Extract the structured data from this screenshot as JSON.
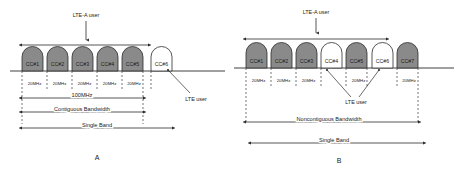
{
  "diagrams": [
    {
      "caption": "A",
      "user_span_label": "LTE-A user",
      "lte_user_label": "LTE user",
      "carriers": [
        {
          "label": "CC#1",
          "filled": true,
          "bandwidth": "20MHz"
        },
        {
          "label": "CC#2",
          "filled": true,
          "bandwidth": "20MHz"
        },
        {
          "label": "CC#3",
          "filled": true,
          "bandwidth": "20MHz"
        },
        {
          "label": "CC#4",
          "filled": true,
          "bandwidth": "20MHz"
        },
        {
          "label": "CC#5",
          "filled": true,
          "bandwidth": "20MHz"
        },
        {
          "label": "CC#6",
          "filled": false,
          "bandwidth": ""
        }
      ],
      "measures": [
        {
          "label": "100MHz"
        },
        {
          "label": "Contiguous Bandwidth"
        },
        {
          "label": "Single Band"
        }
      ]
    },
    {
      "caption": "B",
      "user_span_label": "LTE-A user",
      "lte_user_label": "LTE user",
      "carriers": [
        {
          "label": "CC#1",
          "filled": true,
          "bandwidth": "20MHz"
        },
        {
          "label": "CC#2",
          "filled": true,
          "bandwidth": "20MHz"
        },
        {
          "label": "CC#3",
          "filled": true,
          "bandwidth": "20MHz"
        },
        {
          "label": "CC#4",
          "filled": false,
          "bandwidth": ""
        },
        {
          "label": "CC#5",
          "filled": true,
          "bandwidth": "20MHz"
        },
        {
          "label": "CC#6",
          "filled": false,
          "bandwidth": ""
        },
        {
          "label": "CC#7",
          "filled": true,
          "bandwidth": "20MHz"
        }
      ],
      "measures": [
        {
          "label": "Noncontiguous Bandwidth"
        },
        {
          "label": "Single Band"
        }
      ]
    }
  ],
  "colors": {
    "carrier_fill": "#8a8a8a",
    "carrier_empty": "#ffffff",
    "stroke": "#2b2b2b"
  }
}
